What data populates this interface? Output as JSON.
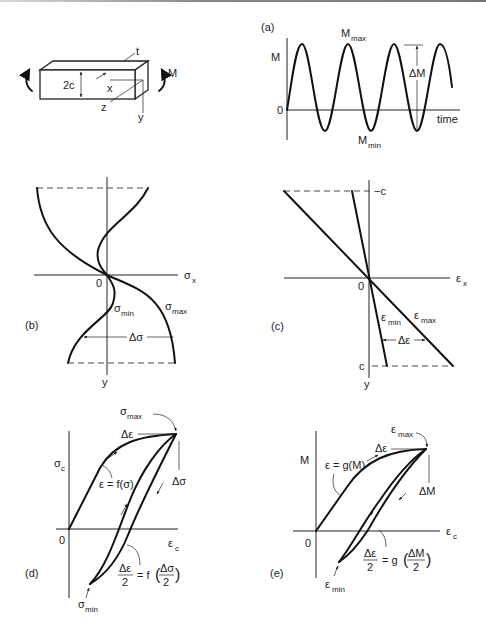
{
  "figure": {
    "panels": {
      "beam": {
        "labels": {
          "t": "t",
          "height": "2c",
          "x": "x",
          "z": "z",
          "y": "y",
          "moment": "M"
        }
      },
      "a": {
        "tag": "(a)",
        "y_axis": "M",
        "origin": "0",
        "x_axis": "time",
        "max_label": "M",
        "max_sub": "max",
        "min_label": "M",
        "min_sub": "min",
        "range_label": "ΔM"
      },
      "b": {
        "tag": "(b)",
        "x_axis": "σ",
        "x_sub": "x",
        "y_axis": "y",
        "origin": "0",
        "min_label": "σ",
        "min_sub": "min",
        "max_label": "σ",
        "max_sub": "max",
        "range_label": "Δσ"
      },
      "c": {
        "tag": "(c)",
        "x_axis": "ε",
        "x_sub": "x",
        "y_axis": "y",
        "origin": "0",
        "top_label": "−c",
        "bottom_label": "c",
        "min_label": "ε",
        "min_sub": "min",
        "max_label": "ε",
        "max_sub": "max",
        "range_label": "Δε"
      },
      "d": {
        "tag": "(d)",
        "y_axis": "σ",
        "y_sub": "c",
        "x_axis": "ε",
        "x_sub": "c",
        "origin": "0",
        "max_label": "σ",
        "max_sub": "max",
        "min_label": "σ",
        "min_sub": "min",
        "strain_range": "Δε",
        "stress_range": "Δσ",
        "monotonic_eq": "ε = f(σ)",
        "cyclic_eq_lhs_num": "Δε",
        "cyclic_eq_lhs_den": "2",
        "cyclic_eq_mid": "= f",
        "cyclic_eq_rhs_num": "Δσ",
        "cyclic_eq_rhs_den": "2"
      },
      "e": {
        "tag": "(e)",
        "y_axis": "M",
        "x_axis": "ε",
        "x_sub": "c",
        "origin": "0",
        "max_label": "ε",
        "max_sub": "max",
        "min_label": "ε",
        "min_sub": "min",
        "strain_range": "Δε",
        "moment_range": "ΔM",
        "monotonic_eq": "ε = g(M)",
        "cyclic_eq_lhs_num": "Δε",
        "cyclic_eq_lhs_den": "2",
        "cyclic_eq_mid": "= g",
        "cyclic_eq_rhs_num": "ΔM",
        "cyclic_eq_rhs_den": "2"
      }
    }
  }
}
